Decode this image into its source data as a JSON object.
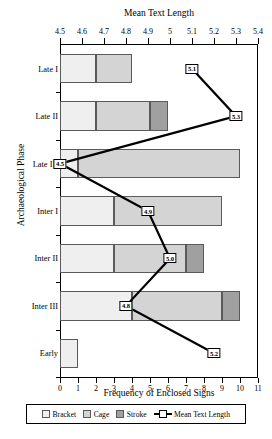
{
  "chart_data": {
    "type": "bar",
    "orientation": "horizontal",
    "title": "",
    "top_axis_title": "Mean Text Length",
    "xlabel": "Frequency of Enclosed Signs",
    "ylabel": "Archaeological Phase",
    "categories": [
      "Late I",
      "Late II",
      "Late III",
      "Inter I",
      "Inter II",
      "Inter III",
      "Early"
    ],
    "xlim": [
      0,
      11
    ],
    "xticks": [
      0,
      1,
      2,
      3,
      4,
      5,
      6,
      7,
      8,
      9,
      10,
      11
    ],
    "xticklabels": [
      "0",
      "1",
      "2",
      "3",
      "4",
      "5",
      "6",
      "7",
      "8",
      "9",
      "10",
      "11"
    ],
    "top_axis_range": [
      4.5,
      5.4
    ],
    "top_axis_ticks": [
      4.5,
      4.6,
      4.7,
      4.8,
      4.9,
      5.0,
      5.1,
      5.2,
      5.3,
      5.4
    ],
    "top_axis_ticklabels": [
      "4.5",
      "4.6",
      "4.7",
      "4.8",
      "4.9",
      "5",
      "5.1",
      "5.2",
      "5.3",
      "5.4"
    ],
    "grid": false,
    "stacked": true,
    "series": [
      {
        "name": "Bracket",
        "color": "#efefef",
        "values": [
          2,
          2,
          1,
          3,
          3,
          4,
          1
        ]
      },
      {
        "name": "Cage",
        "color": "#d4d4d4",
        "values": [
          2,
          3,
          9,
          6,
          4,
          5,
          0
        ]
      },
      {
        "name": "Stroke",
        "color": "#a0a0a0",
        "values": [
          0,
          1,
          0,
          0,
          1,
          1,
          0
        ]
      }
    ],
    "line_series": {
      "name": "Mean Text Length",
      "axis": "top",
      "values": [
        5.1,
        5.3,
        4.5,
        4.9,
        5.0,
        4.8,
        5.2
      ],
      "labels": [
        "5.1",
        "5.3",
        "4.5",
        "4.9",
        "5.0",
        "4.8",
        "5.2"
      ]
    },
    "legend": {
      "position": "bottom",
      "entries": [
        "Bracket",
        "Cage",
        "Stroke",
        "Mean Text Length"
      ]
    }
  }
}
